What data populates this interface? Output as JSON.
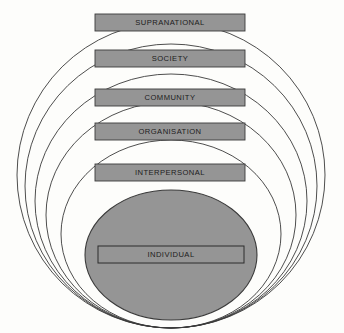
{
  "diagram": {
    "type": "nested-ellipse-hierarchy",
    "colors": {
      "fill_gray": "#959595",
      "stroke_dark": "#3a3a3a",
      "label_text": "#1c1c1c",
      "background": "#fdfdfb"
    },
    "levels": [
      {
        "id": "supranational",
        "label": "SUPRANATIONAL",
        "order": 1,
        "scope": "outermost",
        "box": {
          "x": 95,
          "y": 14,
          "width": 150,
          "height": 17
        },
        "ellipse": {
          "cx": 171,
          "cy": 175,
          "rx": 154,
          "ry": 153
        }
      },
      {
        "id": "society",
        "label": "SOCIETY",
        "order": 2,
        "scope": "outer",
        "box": {
          "x": 95,
          "y": 50,
          "width": 150,
          "height": 17
        },
        "ellipse": {
          "cx": 171,
          "cy": 186,
          "rx": 146,
          "ry": 142
        }
      },
      {
        "id": "community",
        "label": "COMMUNITY",
        "order": 3,
        "scope": "middle",
        "box": {
          "x": 95,
          "y": 89,
          "width": 150,
          "height": 17
        },
        "ellipse": {
          "cx": 171,
          "cy": 201,
          "rx": 136,
          "ry": 127
        }
      },
      {
        "id": "organisation",
        "label": "ORGANISATION",
        "order": 4,
        "scope": "inner-middle",
        "box": {
          "x": 95,
          "y": 123,
          "width": 150,
          "height": 17
        },
        "ellipse": {
          "cx": 171,
          "cy": 215,
          "rx": 125,
          "ry": 113
        }
      },
      {
        "id": "interpersonal",
        "label": "INTERPERSONAL",
        "order": 5,
        "scope": "inner",
        "box": {
          "x": 95,
          "y": 164,
          "width": 150,
          "height": 17
        },
        "ellipse": {
          "cx": 171,
          "cy": 234,
          "rx": 110,
          "ry": 94
        }
      },
      {
        "id": "individual",
        "label": "INDIVIDUAL",
        "order": 6,
        "scope": "core",
        "box": {
          "x": 98,
          "y": 246,
          "width": 146,
          "height": 17
        },
        "ellipse": {
          "cx": 171,
          "cy": 255,
          "rx": 86,
          "ry": 65
        }
      }
    ]
  }
}
